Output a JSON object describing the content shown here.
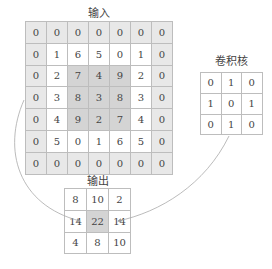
{
  "input": {
    "title": "输入",
    "rows": [
      [
        "0",
        "0",
        "0",
        "0",
        "0",
        "0",
        "0"
      ],
      [
        "0",
        "1",
        "6",
        "5",
        "0",
        "1",
        "0"
      ],
      [
        "0",
        "2",
        "7",
        "4",
        "9",
        "2",
        "0"
      ],
      [
        "0",
        "3",
        "8",
        "3",
        "8",
        "3",
        "0"
      ],
      [
        "0",
        "4",
        "9",
        "2",
        "7",
        "4",
        "0"
      ],
      [
        "0",
        "5",
        "0",
        "1",
        "6",
        "5",
        "0"
      ],
      [
        "0",
        "0",
        "0",
        "0",
        "0",
        "0",
        "0"
      ]
    ]
  },
  "kernel": {
    "title": "卷积核",
    "rows": [
      [
        "0",
        "1",
        "0"
      ],
      [
        "1",
        "0",
        "1"
      ],
      [
        "0",
        "1",
        "0"
      ]
    ]
  },
  "output": {
    "title": "输出",
    "rows": [
      [
        "8",
        "10",
        "2"
      ],
      [
        "14",
        "22",
        "14"
      ],
      [
        "4",
        "8",
        "10"
      ]
    ]
  },
  "colors": {
    "padding": "#e8e8e8",
    "window": "#d4d4d4",
    "border": "#bdbdbd",
    "arrow": "#999999"
  }
}
